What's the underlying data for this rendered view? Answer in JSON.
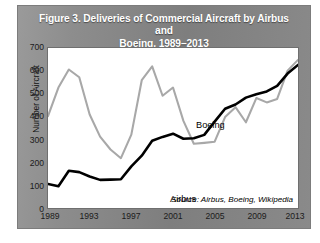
{
  "figure": {
    "title_line1": "Figure 3. Deliveries of Commercial Aircraft by Airbus and",
    "title_line2": "Boeing, 1989–2013",
    "source_note": "Source: Airbus, Boeing, Wikipedia",
    "label_boeing": "Boeing",
    "label_airbus": "Airbus",
    "card_color": "#8a8a8a",
    "title_color": "#ffffff",
    "plot_background": "#ffffff"
  },
  "chart_data": {
    "type": "line",
    "title": "Figure 3. Deliveries of Commercial Aircraft by Airbus and Boeing, 1989–2013",
    "xlabel": "",
    "ylabel": "Number of Aircraft",
    "xlim": [
      1989,
      2013
    ],
    "ylim": [
      0,
      700
    ],
    "ytick_values": [
      0,
      100,
      200,
      300,
      400,
      500,
      600,
      700
    ],
    "ytick_labels": [
      "0",
      "100",
      "200",
      "300",
      "400",
      "500",
      "600",
      "700"
    ],
    "xtick_values": [
      1989,
      1993,
      1997,
      2001,
      2005,
      2009,
      2013
    ],
    "xtick_labels": [
      "1989",
      "1993",
      "1997",
      "2001",
      "2005",
      "2009",
      "2013"
    ],
    "grid": false,
    "legend": "inline-annotations",
    "x": [
      1989,
      1990,
      1991,
      1992,
      1993,
      1994,
      1995,
      1996,
      1997,
      1998,
      1999,
      2000,
      2001,
      2002,
      2003,
      2004,
      2005,
      2006,
      2007,
      2008,
      2009,
      2010,
      2011,
      2012,
      2013
    ],
    "series": [
      {
        "name": "Boeing",
        "color": "#a8a8a8",
        "values": [
          402,
          527,
          606,
          572,
          409,
          312,
          256,
          218,
          321,
          559,
          620,
          491,
          527,
          381,
          281,
          285,
          290,
          398,
          441,
          375,
          481,
          462,
          477,
          601,
          648
        ]
      },
      {
        "name": "Airbus",
        "color": "#000000",
        "values": [
          105,
          95,
          163,
          157,
          138,
          123,
          124,
          126,
          182,
          229,
          294,
          311,
          325,
          303,
          305,
          320,
          378,
          434,
          453,
          483,
          498,
          510,
          534,
          588,
          626
        ]
      }
    ],
    "annotations": [
      {
        "text": "Boeing",
        "x": 1999,
        "y": 560
      },
      {
        "text": "Airbus",
        "x": 1997,
        "y": 215
      },
      {
        "text": "Source: Airbus, Boeing, Wikipedia",
        "x": 2013,
        "y": 60
      }
    ]
  }
}
